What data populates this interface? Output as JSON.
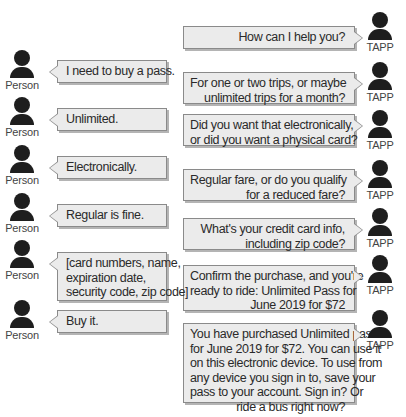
{
  "participants": {
    "person_label": "Person",
    "system_label": "TAPP"
  },
  "colors": {
    "bubble_fill": "#ebebeb",
    "bubble_border": "#8a8a8a",
    "avatar": "#1e1e1e"
  },
  "system_messages": [
    {
      "lines": [
        "How can I help you?"
      ]
    },
    {
      "lines": [
        "For one or two trips, or maybe",
        "unlimited trips for a month?"
      ]
    },
    {
      "lines": [
        "Did you want that electronically,",
        "or did you want a physical card?"
      ]
    },
    {
      "lines": [
        "Regular fare, or do you qualify",
        "for a reduced fare?"
      ]
    },
    {
      "lines": [
        "What's your credit card info,",
        "including zip code?"
      ]
    },
    {
      "lines": [
        "Confirm the purchase, and you're",
        "ready to ride: Unlimited Pass for",
        "June 2019 for $72"
      ]
    },
    {
      "lines": [
        "You have purchased Unlimited pass",
        "for June 2019 for $72. You can use it",
        "on this electronic device. To use from",
        "any device you sign in to, save your",
        "pass to your account. Sign in? Or",
        "ride a bus right now?"
      ]
    }
  ],
  "person_messages": [
    {
      "lines": [
        "I need to buy a pass."
      ]
    },
    {
      "lines": [
        "Unlimited."
      ]
    },
    {
      "lines": [
        "Electronically."
      ]
    },
    {
      "lines": [
        "Regular is fine."
      ]
    },
    {
      "lines": [
        "[card numbers, name,",
        "expiration date,",
        "security code, zip code]"
      ]
    },
    {
      "lines": [
        "Buy it."
      ]
    }
  ]
}
